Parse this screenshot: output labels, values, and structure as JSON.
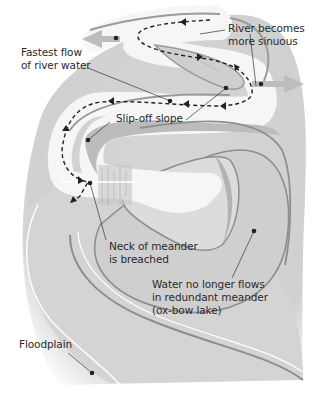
{
  "diagram": {
    "colors": {
      "floodplain": "#d9d9d9",
      "floodplain_shadow": "#c4c4c4",
      "river": "#f4f4f4",
      "bank": "#9a9a9a",
      "slope": "#b8b8b8",
      "arrow": "#bdbdbd",
      "flow_line": "#222222",
      "dot": "#222222",
      "text": "#2a2a2a"
    },
    "labels": {
      "river_sinuous": {
        "line1": "River becomes",
        "line2": "more sinuous"
      },
      "fastest_flow": {
        "line1": "Fastest flow",
        "line2": "of river water"
      },
      "slip_off": {
        "line1": "Slip-off slope"
      },
      "neck": {
        "line1": "Neck of meander",
        "line2": "is breached"
      },
      "oxbow": {
        "line1": "Water no longer flows",
        "line2": "in redundant meander",
        "line3": "(ox-bow lake)"
      },
      "floodplain": {
        "line1": "Floodplain"
      }
    },
    "arrows": [
      {
        "name": "lateral-erosion-left",
        "direction": "left"
      },
      {
        "name": "lateral-erosion-right",
        "direction": "right"
      }
    ]
  }
}
